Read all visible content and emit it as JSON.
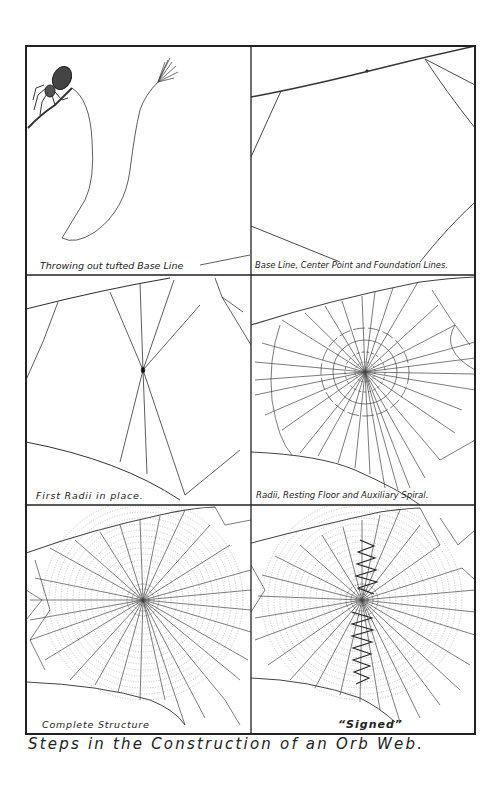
{
  "figure": {
    "title": "Steps in the Construction of an Orb Web.",
    "panels": [
      {
        "id": 1,
        "caption": "Throwing out tufted Base Line"
      },
      {
        "id": 2,
        "caption": "Base Line, Center Point and Foundation Lines."
      },
      {
        "id": 3,
        "caption": "First Radii in place."
      },
      {
        "id": 4,
        "caption": "Radii, Resting Floor and Auxiliary Spiral."
      },
      {
        "id": 5,
        "caption": "Complete Structure"
      },
      {
        "id": 6,
        "caption": "“Signed”"
      }
    ],
    "colors": {
      "ink": "#222222",
      "paper": "#ffffff",
      "faint": "#888888"
    }
  }
}
